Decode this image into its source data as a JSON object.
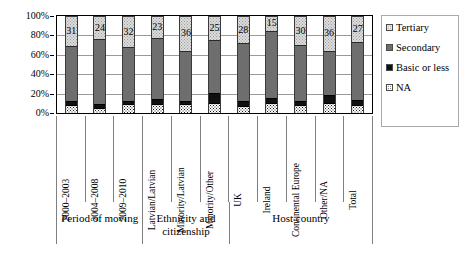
{
  "chart_data": {
    "type": "bar",
    "subtype": "stacked-100-percent-vertical",
    "title": "",
    "xlabel": "",
    "ylabel": "",
    "ylim": [
      0,
      100
    ],
    "yticks": [
      "0%",
      "20%",
      "40%",
      "60%",
      "80%",
      "100%"
    ],
    "grid": true,
    "legend_position": "right",
    "categories": [
      "2000–2003",
      "2004–2008",
      "2009–2010",
      "Latvian/Latvian",
      "Minority/Latvian",
      "Minority/Other",
      "UK",
      "Ireland",
      "Continental Europe",
      "Other/NA",
      "Total"
    ],
    "category_groups": [
      {
        "label": "Period of moving",
        "span": 3
      },
      {
        "label": "Ethnicity and citizenship",
        "span": 3
      },
      {
        "label": "Host country",
        "span": 5
      }
    ],
    "series": [
      {
        "name": "NA",
        "values": [
          8,
          5,
          9,
          9,
          9,
          10,
          7,
          10,
          8,
          10,
          8
        ]
      },
      {
        "name": "Basic or less",
        "values": [
          4,
          4,
          3,
          5,
          3,
          11,
          5,
          5,
          4,
          9,
          5
        ]
      },
      {
        "name": "Secondary",
        "values": [
          57,
          67,
          56,
          63,
          52,
          54,
          60,
          70,
          58,
          45,
          60
        ]
      },
      {
        "name": "Tertiary",
        "values": [
          31,
          24,
          32,
          23,
          36,
          25,
          28,
          15,
          30,
          36,
          27
        ]
      }
    ],
    "data_labels": {
      "series": "Tertiary",
      "values": [
        31,
        24,
        32,
        23,
        36,
        25,
        28,
        15,
        30,
        36,
        27
      ]
    },
    "colors": {
      "tertiary": "#dcdcdc",
      "secondary": "#6e6e6e",
      "basic_or_less": "#101010",
      "na": "#ffffff",
      "axis": "#000000",
      "gridline": "#9a9a9a"
    }
  },
  "legend": {
    "items": [
      {
        "label": "Tertiary",
        "swatch": "tertiary-swatch-icon"
      },
      {
        "label": "Secondary",
        "swatch": "secondary-swatch-icon"
      },
      {
        "label": "Basic or less",
        "swatch": "basic-or-less-swatch-icon"
      },
      {
        "label": "NA",
        "swatch": "na-swatch-icon"
      }
    ]
  }
}
